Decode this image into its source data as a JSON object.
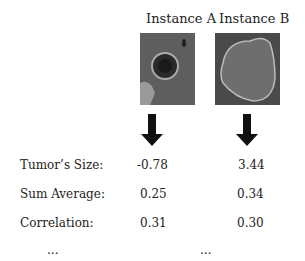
{
  "instances": [
    {
      "title": "Instance A",
      "image_desc": "ct-scan-small-round-tumor"
    },
    {
      "title": "Instance B",
      "image_desc": "ct-scan-large-irregular-tumor"
    }
  ],
  "rows": [
    {
      "label": "Tumor’s Size:",
      "a": "-0.78",
      "b": "3.44"
    },
    {
      "label": "Sum Average:",
      "a": "0.25",
      "b": "0.34"
    },
    {
      "label": "Correlation:",
      "a": "0.31",
      "b": "0.30"
    }
  ],
  "ellipsis": "..."
}
